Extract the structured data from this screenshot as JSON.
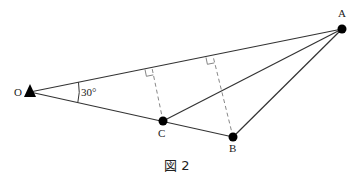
{
  "figure": {
    "caption": "図 2",
    "points": {
      "O": {
        "label": "O",
        "x": 30,
        "y": 92
      },
      "A": {
        "label": "A",
        "x": 342,
        "y": 29
      },
      "B": {
        "label": "B",
        "x": 233,
        "y": 137
      },
      "C": {
        "label": "C",
        "x": 163,
        "y": 121
      }
    },
    "angle_label": "30°",
    "perpendicular_feet": [
      {
        "from": "C",
        "x": 152,
        "y": 68
      },
      {
        "from": "B",
        "x": 213,
        "y": 56
      }
    ]
  }
}
